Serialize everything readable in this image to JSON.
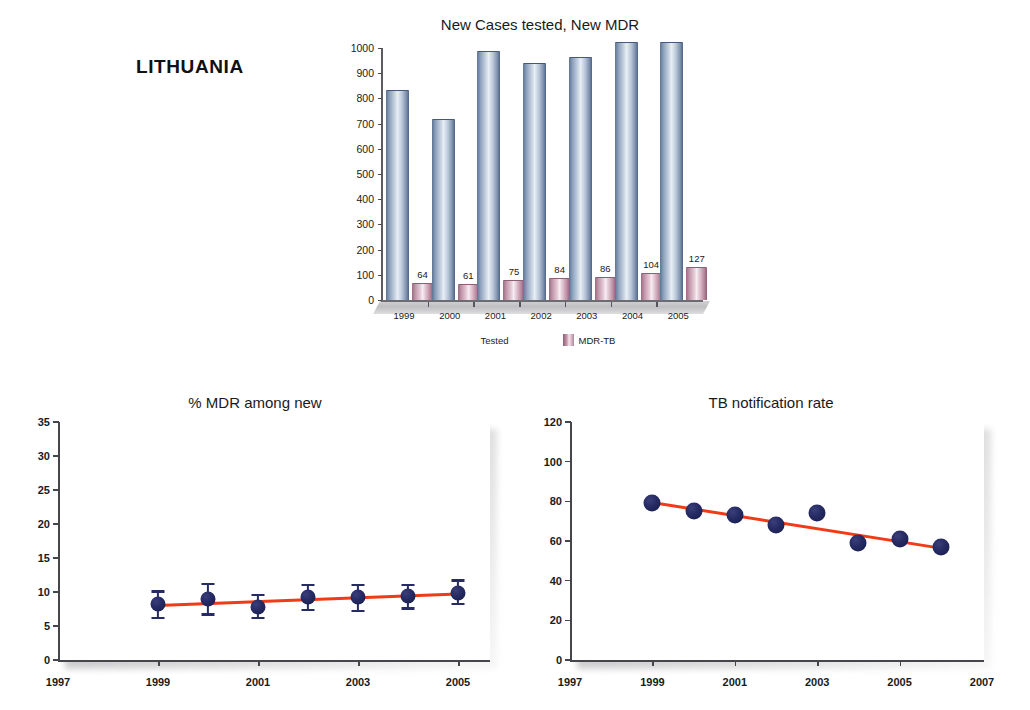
{
  "country": "LITHUANIA",
  "charts": {
    "bar": {
      "title": "New Cases tested, New MDR",
      "legend": [
        {
          "label": "Tested",
          "swatch": "tested-swatch",
          "color": "#7d90ae"
        },
        {
          "label": "MDR-TB",
          "swatch": "mdr-swatch",
          "color": "#b4839a"
        }
      ]
    },
    "mdr": {
      "title": "% MDR among new"
    },
    "tb": {
      "title": "TB notification rate"
    }
  },
  "chart_data": [
    {
      "type": "bar",
      "title": "New Cases tested, New MDR",
      "xlabel": "",
      "ylabel": "",
      "ylim": [
        0,
        1000
      ],
      "yticks": [
        0,
        100,
        200,
        300,
        400,
        500,
        600,
        700,
        800,
        900,
        1000
      ],
      "grid": false,
      "legend_position": "bottom",
      "categories": [
        "1999",
        "2000",
        "2001",
        "2002",
        "2003",
        "2004",
        "2005"
      ],
      "series": [
        {
          "name": "Tested",
          "values": [
            830,
            715,
            985,
            935,
            960,
            1020,
            1020
          ],
          "color": "#7d90ae",
          "labels_shown": false
        },
        {
          "name": "MDR-TB",
          "values": [
            64,
            61,
            75,
            84,
            86,
            104,
            127
          ],
          "color": "#b4839a",
          "labels_shown": true
        }
      ]
    },
    {
      "type": "scatter",
      "title": "% MDR among new",
      "xlabel": "",
      "ylabel": "",
      "ylim": [
        0,
        35
      ],
      "yticks": [
        0,
        5,
        10,
        15,
        20,
        25,
        30,
        35
      ],
      "xlim": [
        1997,
        2005.6
      ],
      "xticks": [
        1997,
        1999,
        2001,
        2003,
        2005
      ],
      "xticklabels": [
        "1997",
        "1999",
        "2001",
        "2003",
        "2005"
      ],
      "grid": false,
      "x": [
        1999,
        2000,
        2001,
        2002,
        2003,
        2004,
        2005
      ],
      "values": [
        8.2,
        8.9,
        7.8,
        9.3,
        9.3,
        9.4,
        9.9
      ],
      "error_low": [
        6.2,
        6.7,
        6.2,
        7.4,
        7.2,
        7.6,
        8.2
      ],
      "error_high": [
        10.1,
        11.2,
        9.6,
        11.1,
        11.0,
        11.1,
        11.7
      ],
      "trendline": {
        "name": "linear fit",
        "x": [
          1999,
          2005
        ],
        "y": [
          8.3,
          10.0
        ],
        "color": "#f03b16"
      },
      "point_color": "#252a63"
    },
    {
      "type": "scatter",
      "title": "TB notification rate",
      "xlabel": "",
      "ylabel": "",
      "ylim": [
        0,
        120
      ],
      "yticks": [
        0,
        20,
        40,
        60,
        80,
        100,
        120
      ],
      "xlim": [
        1997,
        2007
      ],
      "xticks": [
        1997,
        1999,
        2001,
        2003,
        2005,
        2007
      ],
      "xticklabels": [
        "1997",
        "1999",
        "2001",
        "2003",
        "2005",
        "2007"
      ],
      "grid": false,
      "x": [
        1999,
        2000,
        2001,
        2002,
        2003,
        2004,
        2005,
        2006
      ],
      "values": [
        79,
        75,
        73,
        68,
        74,
        59,
        61,
        57
      ],
      "trendline": {
        "name": "linear fit",
        "x": [
          1999,
          2006
        ],
        "y": [
          80,
          57
        ],
        "color": "#f03b16"
      },
      "point_color": "#252a63"
    }
  ]
}
